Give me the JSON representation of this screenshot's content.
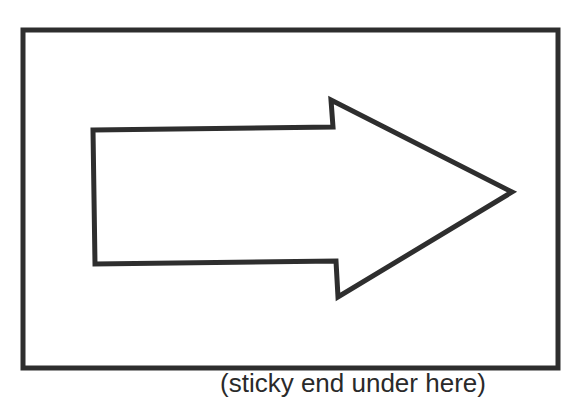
{
  "diagram": {
    "frame": {
      "x": 23,
      "y": 30,
      "width": 535,
      "height": 338,
      "stroke": "#2e2e2e",
      "stroke_width": 5
    },
    "arrow": {
      "direction": "right",
      "points": "93,130 333,127 331,100 512,192 338,297 336,261 95,264",
      "stroke": "#2e2e2e",
      "stroke_width": 5,
      "fill": "#ffffff"
    },
    "caption": "(sticky end under here)"
  }
}
